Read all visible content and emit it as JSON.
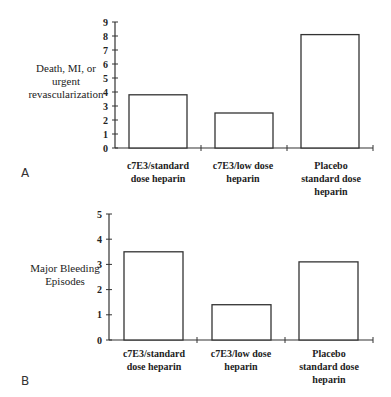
{
  "chart_data": [
    {
      "type": "bar",
      "panel": "A",
      "title": "",
      "ylabel": "Death, MI, or urgent revascularization",
      "xlabel": "",
      "categories": [
        "c7E3/standard dose heparin",
        "c7E3/low dose heparin",
        "Placebo standard dose heparin"
      ],
      "category_lines": [
        [
          "c7E3/standard",
          "dose heparin"
        ],
        [
          "c7E3/low dose",
          "heparin"
        ],
        [
          "Placebo",
          "standard dose",
          "heparin"
        ]
      ],
      "values": [
        3.8,
        2.5,
        8.1
      ],
      "ylim": [
        0,
        9
      ],
      "yticks": [
        0,
        1,
        2,
        3,
        4,
        5,
        6,
        7,
        8,
        9
      ],
      "grid": false,
      "legend": "none"
    },
    {
      "type": "bar",
      "panel": "B",
      "title": "",
      "ylabel": "Major Bleeding Episodes",
      "xlabel": "",
      "categories": [
        "c7E3/standard dose heparin",
        "c7E3/low dose heparin",
        "Placebo standard dose heparin"
      ],
      "category_lines": [
        [
          "c7E3/standard",
          "dose heparin"
        ],
        [
          "c7E3/low dose",
          "heparin"
        ],
        [
          "Placebo",
          "standard dose",
          "heparin"
        ]
      ],
      "values": [
        3.5,
        1.4,
        3.1
      ],
      "ylim": [
        0,
        5
      ],
      "yticks": [
        0,
        1,
        2,
        3,
        4,
        5
      ],
      "grid": false,
      "legend": "none"
    }
  ],
  "panels": {
    "a": {
      "label": "A",
      "ylabel_lines": [
        "Death, MI, or",
        "urgent",
        "revascularization"
      ],
      "cat": [
        [
          "c7E3/standard",
          "dose heparin"
        ],
        [
          "c7E3/low dose",
          "heparin"
        ],
        [
          "Placebo",
          "standard dose",
          "heparin"
        ]
      ]
    },
    "b": {
      "label": "B",
      "ylabel_lines": [
        "Major Bleeding",
        "Episodes"
      ],
      "cat": [
        [
          "c7E3/standard",
          "dose heparin"
        ],
        [
          "c7E3/low dose",
          "heparin"
        ],
        [
          "Placebo",
          "standard dose",
          "heparin"
        ]
      ]
    }
  }
}
